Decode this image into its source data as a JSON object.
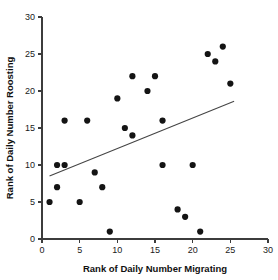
{
  "chart_data": {
    "type": "scatter",
    "title": "",
    "xlabel": "Rank of Daily Number Migrating",
    "ylabel": "Rank of Daily Number Roosting",
    "xlim": [
      0,
      30
    ],
    "ylim": [
      0,
      30
    ],
    "xticks": [
      0,
      5,
      10,
      15,
      20,
      25,
      30
    ],
    "yticks": [
      0,
      5,
      10,
      15,
      20,
      25,
      30
    ],
    "xtick_labels": [
      "0",
      "5",
      "10",
      "15",
      "20",
      "25",
      "30"
    ],
    "ytick_labels": [
      "0",
      "5",
      "10",
      "15",
      "20",
      "25",
      "30"
    ],
    "grid": false,
    "legend": false,
    "marker_color": "#141414",
    "marker_size": 3.1,
    "axis_color": "#3c3c3c",
    "points": [
      {
        "x": 1,
        "y": 5
      },
      {
        "x": 2,
        "y": 10
      },
      {
        "x": 2,
        "y": 7
      },
      {
        "x": 3,
        "y": 10
      },
      {
        "x": 3,
        "y": 16
      },
      {
        "x": 5,
        "y": 5
      },
      {
        "x": 6,
        "y": 16
      },
      {
        "x": 7,
        "y": 9
      },
      {
        "x": 8,
        "y": 7
      },
      {
        "x": 9,
        "y": 1
      },
      {
        "x": 10,
        "y": 19
      },
      {
        "x": 11,
        "y": 15
      },
      {
        "x": 12,
        "y": 14
      },
      {
        "x": 12,
        "y": 22
      },
      {
        "x": 14,
        "y": 20
      },
      {
        "x": 15,
        "y": 22
      },
      {
        "x": 16,
        "y": 10
      },
      {
        "x": 16,
        "y": 16
      },
      {
        "x": 18,
        "y": 4
      },
      {
        "x": 19,
        "y": 3
      },
      {
        "x": 20,
        "y": 10
      },
      {
        "x": 21,
        "y": 1
      },
      {
        "x": 22,
        "y": 25
      },
      {
        "x": 23,
        "y": 24
      },
      {
        "x": 24,
        "y": 26
      },
      {
        "x": 25,
        "y": 21
      }
    ],
    "trend_line": {
      "x0": 1.0,
      "y0": 8.5,
      "x1": 25.5,
      "y1": 18.6,
      "color": "#444444"
    }
  }
}
